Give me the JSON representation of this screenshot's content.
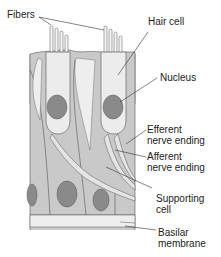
{
  "diagram": {
    "labels": {
      "fibers": "Fibers",
      "hair_cell": "Hair cell",
      "nucleus": "Nucleus",
      "efferent": "Efferent\nnerve ending",
      "afferent": "Afferent\nnerve ending",
      "supporting": "Supporting\ncell",
      "basilar": "Basilar\nmembrane"
    },
    "colors": {
      "tissue": "#c9c9c9",
      "hair_cell": "#ececec",
      "nucleus": "#8a8a8a",
      "outline": "#555555",
      "nerve": "#e4e4e4"
    }
  }
}
